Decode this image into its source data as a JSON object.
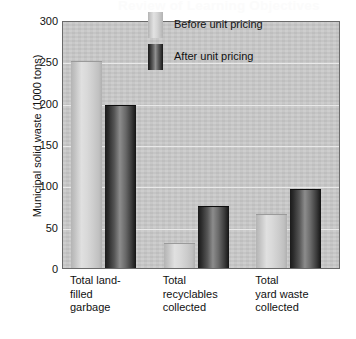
{
  "ghost_header": "Review of Learning Objectives",
  "chart_data": {
    "type": "bar",
    "title": "",
    "xlabel": "",
    "ylabel": "Municipal solid waste (1000 tons)",
    "ylim": [
      0,
      300
    ],
    "yticks": [
      0,
      50,
      100,
      150,
      200,
      250,
      300
    ],
    "ytick_labels": [
      "0",
      "50",
      "100",
      "150",
      "200",
      "250",
      "300"
    ],
    "grid": true,
    "legend_position": "upper right",
    "categories": [
      "Total land-\nfilled\ngarbage",
      "Total\nrecyclables\ncollected",
      "Total\nyard waste\ncollected"
    ],
    "series": [
      {
        "name": "Before unit pricing",
        "color": "#d6d6d6",
        "values": [
          250,
          30,
          65
        ]
      },
      {
        "name": "After unit pricing",
        "color": "#2b2b2b",
        "values": [
          197,
          75,
          95
        ]
      }
    ]
  }
}
